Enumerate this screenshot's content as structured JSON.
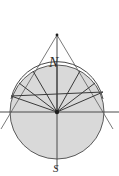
{
  "figure": {
    "background_color": "#ffffff",
    "stroke_color": "#4a4a4a",
    "dark_stroke_color": "#2f2f2f",
    "circle_fill_color": "#d9d9d9",
    "label_color": "#2b2b2b"
  },
  "labels": {
    "north": "N",
    "south": "S"
  },
  "geometry": {
    "circle": {
      "cx": 57,
      "cy": 112,
      "r": 47,
      "fill": "#d9d9d9",
      "stroke": "#5a5a5a",
      "stroke_width": 1
    },
    "center_point": {
      "cx": 57,
      "cy": 112,
      "r": 2.1,
      "fill": "#1e1e1e"
    },
    "apex_point": {
      "cx": 57,
      "cy": 35,
      "r": 1.4,
      "fill": "#1e1e1e"
    },
    "vertical_axis": {
      "x1": 57,
      "y1": 35,
      "x2": 57,
      "y2": 168
    },
    "horizontal_axis": {
      "x1": 0,
      "y1": 112,
      "x2": 119,
      "y2": 112
    },
    "tangent_left": {
      "x1": 57,
      "y1": 35,
      "x2": 2,
      "y2": 127
    },
    "tangent_right": {
      "x1": 57,
      "y1": 35,
      "x2": 112,
      "y2": 127
    },
    "chord": {
      "x1": 12,
      "y1": 96,
      "x2": 102,
      "y2": 92
    },
    "spokes": [
      {
        "x1": 57,
        "y1": 112,
        "x2": 12,
        "y2": 96
      },
      {
        "x1": 57,
        "y1": 112,
        "x2": 19,
        "y2": 83
      },
      {
        "x1": 57,
        "y1": 112,
        "x2": 33,
        "y2": 72
      },
      {
        "x1": 57,
        "y1": 112,
        "x2": 57,
        "y2": 65
      },
      {
        "x1": 57,
        "y1": 112,
        "x2": 80,
        "y2": 72
      },
      {
        "x1": 57,
        "y1": 112,
        "x2": 95,
        "y2": 83
      },
      {
        "x1": 57,
        "y1": 112,
        "x2": 102,
        "y2": 92
      }
    ],
    "upper_arc_highlight": {
      "start_x": 11,
      "start_y": 100,
      "end_x": 103,
      "end_y": 100,
      "sweep_r": 47
    }
  }
}
